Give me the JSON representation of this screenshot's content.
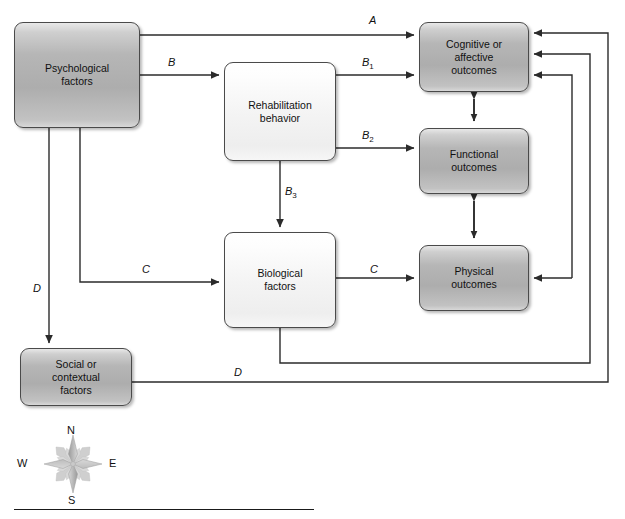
{
  "diagram": {
    "type": "flow-diagram",
    "canvas": {
      "width": 625,
      "height": 519,
      "background": "#ffffff"
    },
    "colors": {
      "node_dark_fill": "#b4b4b4",
      "node_light_fill": "#f4f4f4",
      "node_border": "#4a4a4a",
      "connector": "#2b2b2b",
      "text": "#111111"
    },
    "nodes": [
      {
        "id": "psychological",
        "label": "Psychological\nfactors",
        "shade": "dark",
        "x": 14,
        "y": 22,
        "w": 126,
        "h": 106
      },
      {
        "id": "rehabilitation",
        "label": "Rehabilitation\nbehavior",
        "shade": "light",
        "x": 224,
        "y": 62,
        "w": 112,
        "h": 99
      },
      {
        "id": "biological",
        "label": "Biological\nfactors",
        "shade": "light",
        "x": 224,
        "y": 232,
        "w": 112,
        "h": 96
      },
      {
        "id": "social",
        "label": "Social or\ncontextual\nfactors",
        "shade": "dark",
        "x": 20,
        "y": 348,
        "w": 112,
        "h": 58
      },
      {
        "id": "cognitive",
        "label": "Cognitive or\naffective\noutcomes",
        "shade": "dark",
        "x": 419,
        "y": 22,
        "w": 110,
        "h": 70
      },
      {
        "id": "functional",
        "label": "Functional\noutcomes",
        "shade": "dark",
        "x": 419,
        "y": 128,
        "w": 110,
        "h": 66
      },
      {
        "id": "physical",
        "label": "Physical\noutcomes",
        "shade": "dark",
        "x": 419,
        "y": 245,
        "w": 110,
        "h": 66
      }
    ],
    "edges": [
      {
        "id": "A",
        "label": "A",
        "from": "psychological",
        "to": "cognitive",
        "label_x": 369,
        "label_y": 14
      },
      {
        "id": "B",
        "label": "B",
        "from": "psychological",
        "to": "rehabilitation",
        "label_x": 168,
        "label_y": 56
      },
      {
        "id": "B1",
        "label": "B",
        "sub": "1",
        "from": "rehabilitation",
        "to": "cognitive",
        "label_x": 362,
        "label_y": 56
      },
      {
        "id": "B2",
        "label": "B",
        "sub": "2",
        "from": "rehabilitation",
        "to": "functional",
        "label_x": 362,
        "label_y": 129
      },
      {
        "id": "B3",
        "label": "B",
        "sub": "3",
        "from": "rehabilitation",
        "to": "biological",
        "label_x": 285,
        "label_y": 185
      },
      {
        "id": "C-left",
        "label": "C",
        "from": "psychological",
        "to": "biological",
        "label_x": 142,
        "label_y": 263
      },
      {
        "id": "C-right",
        "label": "C",
        "from": "biological",
        "to": "physical",
        "label_x": 370,
        "label_y": 263
      },
      {
        "id": "D-down",
        "label": "D",
        "from": "psychological",
        "to": "social",
        "label_x": 33,
        "label_y": 282
      },
      {
        "id": "D-right",
        "label": "D",
        "from": "social",
        "to": "cognitive",
        "label_x": 234,
        "label_y": 366
      },
      {
        "id": "cog-func",
        "label": "",
        "from": "cognitive",
        "to": "functional",
        "bidirectional": true
      },
      {
        "id": "func-phys",
        "label": "",
        "from": "functional",
        "to": "physical",
        "bidirectional": true
      },
      {
        "id": "biological-feedback",
        "label": "",
        "from": "biological",
        "to": "cognitive"
      },
      {
        "id": "physical-feedback",
        "label": "",
        "from": "physical-loop",
        "to": "cognitive"
      }
    ],
    "compass": {
      "name": "compass-rose",
      "north": "N",
      "south": "S",
      "east": "E",
      "west": "W",
      "cx": 72,
      "cy": 463
    },
    "footer": {
      "rule_visible": true
    }
  }
}
